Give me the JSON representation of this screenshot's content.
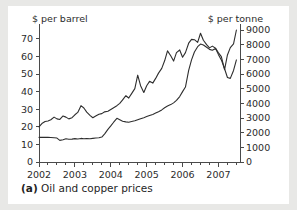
{
  "figure": {
    "caption_label": "(a)",
    "caption_text": " Oil and copper prices"
  },
  "chart_data": {
    "type": "line",
    "title": "",
    "subtitle": "",
    "xlabel": "",
    "ylabel": "$ per barrel",
    "y2label": "$ per tonne",
    "grid": false,
    "legend": "none",
    "xlim": [
      2002.0,
      2007.6
    ],
    "xticks": [
      2002,
      2003,
      2004,
      2005,
      2006,
      2007
    ],
    "xtick_labels": [
      "2002",
      "2003",
      "2004",
      "2005",
      "2006",
      "2007"
    ],
    "x_minor_tick_interval": 0.25,
    "ylim": [
      0,
      75
    ],
    "yticks": [
      0,
      10,
      20,
      30,
      40,
      50,
      60,
      70
    ],
    "ytick_labels": [
      "0",
      "10",
      "20",
      "30",
      "40",
      "50",
      "60",
      "70"
    ],
    "y2lim": [
      0,
      9000
    ],
    "y2ticks": [
      0,
      1000,
      2000,
      3000,
      4000,
      5000,
      6000,
      7000,
      8000,
      9000
    ],
    "y2tick_labels": [
      "0",
      "1000",
      "2000",
      "3000",
      "4000",
      "5000",
      "6000",
      "7000",
      "8000",
      "9000"
    ],
    "line_color": "#2e2e2e",
    "series": [
      {
        "name": "Oil price",
        "axis": "left",
        "units": "$ per barrel",
        "x": [
          2002.0,
          2002.08,
          2002.17,
          2002.25,
          2002.33,
          2002.42,
          2002.5,
          2002.58,
          2002.67,
          2002.75,
          2002.83,
          2002.92,
          2003.0,
          2003.08,
          2003.17,
          2003.25,
          2003.33,
          2003.42,
          2003.5,
          2003.58,
          2003.67,
          2003.75,
          2003.83,
          2003.92,
          2004.0,
          2004.08,
          2004.17,
          2004.25,
          2004.33,
          2004.42,
          2004.5,
          2004.58,
          2004.67,
          2004.75,
          2004.83,
          2004.92,
          2005.0,
          2005.08,
          2005.17,
          2005.25,
          2005.33,
          2005.42,
          2005.5,
          2005.58,
          2005.67,
          2005.75,
          2005.83,
          2005.92,
          2006.0,
          2006.08,
          2006.17,
          2006.25,
          2006.33,
          2006.42,
          2006.5,
          2006.58,
          2006.67,
          2006.75,
          2006.83,
          2006.92,
          2007.0,
          2007.08,
          2007.17,
          2007.25,
          2007.33,
          2007.42,
          2007.5
        ],
        "y": [
          14.0,
          14.0,
          14.0,
          14.0,
          13.9,
          13.8,
          13.6,
          12.3,
          12.6,
          13.2,
          12.9,
          13.0,
          13.3,
          13.1,
          13.4,
          13.2,
          13.3,
          13.2,
          13.4,
          13.6,
          13.8,
          14.2,
          16.0,
          18.5,
          20.5,
          22.6,
          24.8,
          24.0,
          23.2,
          22.8,
          22.6,
          23.0,
          23.4,
          24.0,
          24.6,
          25.2,
          25.8,
          26.4,
          27.0,
          27.8,
          28.6,
          29.6,
          30.8,
          31.8,
          32.6,
          33.6,
          35.0,
          37.2,
          40.0,
          42.6,
          52.0,
          58.0,
          62.5,
          65.5,
          67.0,
          66.5,
          65.2,
          64.0,
          63.5,
          64.5,
          61.0,
          58.0,
          53.0,
          48.0,
          47.5,
          52.0,
          58.0
        ]
      },
      {
        "name": "Copper price",
        "axis": "right",
        "units": "$ per tonne",
        "x": [
          2002.0,
          2002.08,
          2002.17,
          2002.25,
          2002.33,
          2002.42,
          2002.5,
          2002.58,
          2002.67,
          2002.75,
          2002.83,
          2002.92,
          2003.0,
          2003.08,
          2003.17,
          2003.25,
          2003.33,
          2003.42,
          2003.5,
          2003.58,
          2003.67,
          2003.75,
          2003.83,
          2003.92,
          2004.0,
          2004.08,
          2004.17,
          2004.25,
          2004.33,
          2004.42,
          2004.5,
          2004.58,
          2004.67,
          2004.75,
          2004.83,
          2004.92,
          2005.0,
          2005.08,
          2005.17,
          2005.25,
          2005.33,
          2005.42,
          2005.5,
          2005.58,
          2005.67,
          2005.75,
          2005.83,
          2005.92,
          2006.0,
          2006.08,
          2006.17,
          2006.25,
          2006.33,
          2006.42,
          2006.5,
          2006.58,
          2006.67,
          2006.75,
          2006.83,
          2006.92,
          2007.0,
          2007.08,
          2007.17,
          2007.25,
          2007.33,
          2007.42,
          2007.5
        ],
        "y": [
          2400,
          2620,
          2760,
          2800,
          2880,
          3060,
          2940,
          2900,
          3140,
          3060,
          2940,
          3020,
          3220,
          3380,
          3840,
          3680,
          3400,
          3180,
          3020,
          3140,
          3260,
          3300,
          3420,
          3460,
          3580,
          3700,
          3840,
          4000,
          4240,
          4520,
          4360,
          4660,
          5000,
          5920,
          5200,
          4740,
          5200,
          5500,
          5380,
          5700,
          6060,
          6380,
          6900,
          7580,
          7240,
          6880,
          7460,
          7640,
          7140,
          7460,
          8100,
          8360,
          8340,
          8160,
          8780,
          8300,
          8000,
          7780,
          7900,
          7760,
          7440,
          7180,
          6300,
          7300,
          7800,
          8060,
          9000
        ]
      }
    ]
  }
}
